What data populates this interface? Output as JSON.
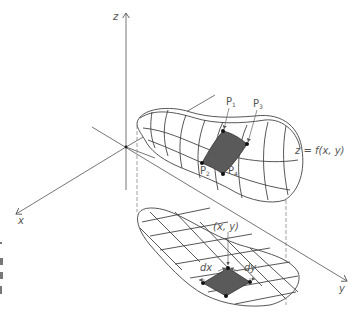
{
  "figure": {
    "type": "3d-surface-projection-diagram",
    "colors": {
      "line": "#555555",
      "shade": "#5a5a5a",
      "point": "#111111",
      "background": "#ffffff"
    }
  },
  "axes": {
    "z_label": "z",
    "x_label": "x",
    "y_label": "y"
  },
  "surface": {
    "equation_label": "z = f(x, y)",
    "points": [
      {
        "name": "P",
        "sub": "1"
      },
      {
        "name": "P",
        "sub": "3"
      },
      {
        "name": "P",
        "sub": "2"
      },
      {
        "name": "P",
        "sub": "4"
      }
    ]
  },
  "domain": {
    "point_label": "(x, y)",
    "dx_label": "dx",
    "dy_label": "dy"
  }
}
